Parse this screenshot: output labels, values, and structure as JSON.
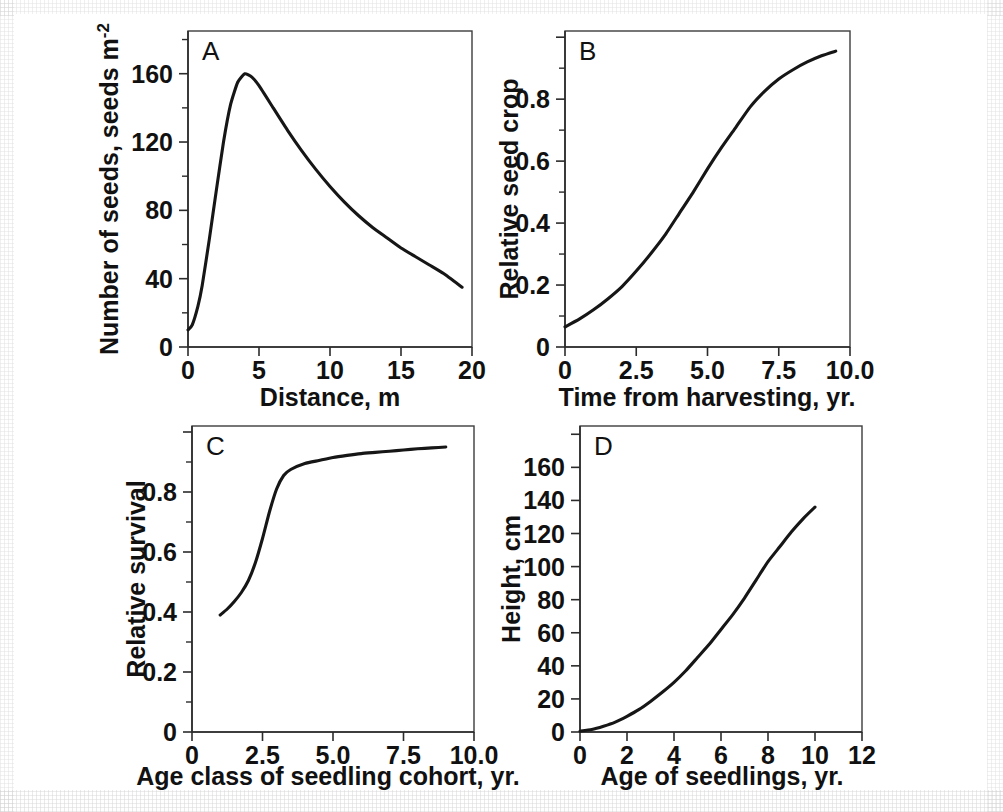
{
  "figure": {
    "panel_count": 4,
    "background_color": "#ffffff",
    "line_color": "#161616",
    "frame_color": "#3d3d3d"
  },
  "panels": {
    "a": {
      "letter": "A",
      "xlabel": "Distance, m",
      "ylabel_main": "Number of seeds, seeds m",
      "ylabel_sup": "-2",
      "xticks": [
        "0",
        "5",
        "10",
        "15",
        "20"
      ],
      "yticks": [
        "0",
        "40",
        "80",
        "120",
        "160"
      ]
    },
    "b": {
      "letter": "B",
      "xlabel": "Time from harvesting, yr.",
      "ylabel": "Relative seed crop",
      "xticks": [
        "0",
        "2.5",
        "5.0",
        "7.5",
        "10.0"
      ],
      "yticks": [
        "0",
        "0.2",
        "0.4",
        "0.6",
        "0.8"
      ]
    },
    "c": {
      "letter": "C",
      "xlabel": "Age class of seedling cohort, yr.",
      "ylabel": "Relative survival",
      "xticks": [
        "0",
        "2.5",
        "5.0",
        "7.5",
        "10.0"
      ],
      "yticks": [
        "0",
        "0.2",
        "0.4",
        "0.6",
        "0.8"
      ]
    },
    "d": {
      "letter": "D",
      "xlabel": "Age of seedlings, yr.",
      "ylabel": "Height, cm",
      "xticks": [
        "0",
        "2",
        "4",
        "6",
        "8",
        "10",
        "12"
      ],
      "yticks": [
        "0",
        "20",
        "40",
        "60",
        "80",
        "100",
        "120",
        "140",
        "160"
      ]
    }
  },
  "chart_data": [
    {
      "id": "a",
      "type": "line",
      "title": "A",
      "xlabel": "Distance, m",
      "ylabel": "Number of seeds, seeds m-2",
      "xlim": [
        0,
        20
      ],
      "ylim": [
        0,
        185
      ],
      "xticks": [
        0,
        5,
        10,
        15,
        20
      ],
      "yticks": [
        0,
        40,
        80,
        120,
        160
      ],
      "grid": false,
      "legend": "none",
      "x": [
        0,
        0.3,
        0.7,
        1.0,
        1.5,
        2.0,
        2.5,
        3.0,
        3.5,
        4.0,
        4.5,
        5.0,
        6.0,
        7.0,
        8.0,
        9.0,
        10.0,
        11.0,
        12.0,
        13.0,
        14.0,
        15.0,
        16.0,
        17.0,
        18.0,
        19.3
      ],
      "values": [
        10,
        13,
        24,
        36,
        63,
        92,
        120,
        142,
        155,
        160,
        158,
        153,
        140,
        127,
        115,
        104,
        94,
        85,
        77,
        70,
        64,
        58,
        53,
        48,
        43,
        35
      ]
    },
    {
      "id": "b",
      "type": "line",
      "title": "B",
      "xlabel": "Time from harvesting, yr.",
      "ylabel": "Relative seed crop",
      "xlim": [
        0,
        10
      ],
      "ylim": [
        0,
        1.02
      ],
      "xticks": [
        0,
        2.5,
        5.0,
        7.5,
        10.0
      ],
      "yticks": [
        0,
        0.2,
        0.4,
        0.6,
        0.8
      ],
      "grid": false,
      "legend": "none",
      "x": [
        0,
        0.5,
        1.0,
        1.5,
        2.0,
        2.5,
        3.0,
        3.5,
        4.0,
        4.5,
        5.0,
        5.5,
        6.0,
        6.5,
        7.0,
        7.5,
        8.0,
        8.5,
        9.0,
        9.5
      ],
      "values": [
        0.065,
        0.09,
        0.12,
        0.155,
        0.195,
        0.245,
        0.3,
        0.36,
        0.43,
        0.5,
        0.575,
        0.645,
        0.71,
        0.775,
        0.825,
        0.865,
        0.895,
        0.92,
        0.94,
        0.955
      ]
    },
    {
      "id": "c",
      "type": "line",
      "title": "C",
      "xlabel": "Age class of seedling cohort, yr.",
      "ylabel": "Relative survival",
      "xlim": [
        0,
        10
      ],
      "ylim": [
        0,
        1.02
      ],
      "xticks": [
        0,
        2.5,
        5.0,
        7.5,
        10.0
      ],
      "yticks": [
        0,
        0.2,
        0.4,
        0.6,
        0.8
      ],
      "grid": false,
      "legend": "none",
      "x": [
        1.0,
        1.25,
        1.5,
        1.75,
        2.0,
        2.25,
        2.5,
        2.75,
        3.0,
        3.25,
        3.5,
        4.0,
        4.5,
        5.0,
        5.5,
        6.0,
        6.5,
        7.0,
        7.5,
        8.0,
        8.5,
        9.0
      ],
      "values": [
        0.39,
        0.41,
        0.435,
        0.465,
        0.505,
        0.565,
        0.645,
        0.735,
        0.81,
        0.855,
        0.875,
        0.895,
        0.905,
        0.915,
        0.922,
        0.928,
        0.932,
        0.936,
        0.94,
        0.944,
        0.947,
        0.95
      ]
    },
    {
      "id": "d",
      "type": "line",
      "title": "D",
      "xlabel": "Age of seedlings, yr.",
      "ylabel": "Height, cm",
      "xlim": [
        0,
        12
      ],
      "ylim": [
        0,
        185
      ],
      "xticks": [
        0,
        2,
        4,
        6,
        8,
        10,
        12
      ],
      "yticks": [
        0,
        20,
        40,
        60,
        80,
        100,
        120,
        140,
        160
      ],
      "grid": false,
      "legend": "none",
      "x": [
        0,
        0.5,
        1.0,
        1.5,
        2.0,
        2.5,
        3.0,
        3.5,
        4.0,
        4.5,
        5.0,
        5.5,
        6.0,
        6.5,
        7.0,
        7.5,
        8.0,
        8.5,
        9.0,
        9.5,
        10.0
      ],
      "values": [
        0.5,
        1.5,
        3.5,
        6,
        9.5,
        13.5,
        18.5,
        24,
        30,
        37,
        45,
        53,
        62,
        71,
        81,
        92,
        103,
        112,
        121,
        129,
        136
      ]
    }
  ]
}
